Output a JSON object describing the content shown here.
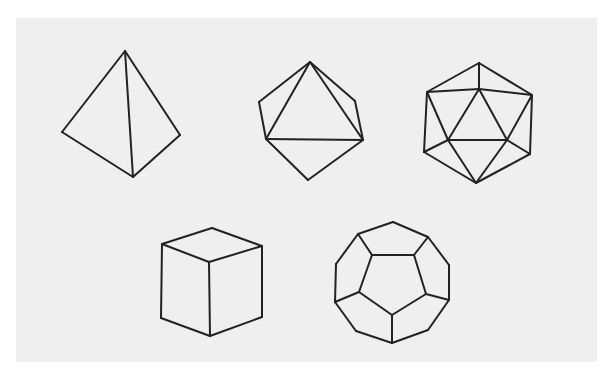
{
  "figure": {
    "background": "#ffffff",
    "panel_color": "#efefef",
    "line_color": "#222222",
    "solids": [
      {
        "name": "tetrahedron",
        "lines": [
          [
            [
              125,
              51
            ],
            [
              62,
              132
            ]
          ],
          [
            [
              62,
              132
            ],
            [
              133,
              177
            ]
          ],
          [
            [
              133,
              177
            ],
            [
              180,
              135
            ]
          ],
          [
            [
              180,
              135
            ],
            [
              125,
              51
            ]
          ],
          [
            [
              125,
              51
            ],
            [
              133,
              177
            ]
          ]
        ]
      },
      {
        "name": "octahedron",
        "lines": [
          [
            [
              310,
              62
            ],
            [
              259,
              102
            ]
          ],
          [
            [
              310,
              62
            ],
            [
              355,
              101
            ]
          ],
          [
            [
              310,
              62
            ],
            [
              266,
              139
            ]
          ],
          [
            [
              310,
              62
            ],
            [
              363,
              140
            ]
          ],
          [
            [
              259,
              102
            ],
            [
              266,
              139
            ]
          ],
          [
            [
              355,
              101
            ],
            [
              363,
              140
            ]
          ],
          [
            [
              266,
              139
            ],
            [
              363,
              140
            ]
          ],
          [
            [
              266,
              139
            ],
            [
              308,
              180
            ]
          ],
          [
            [
              363,
              140
            ],
            [
              308,
              180
            ]
          ]
        ]
      },
      {
        "name": "icosahedron",
        "lines": [
          [
            [
              479,
              63
            ],
            [
              427,
              92
            ]
          ],
          [
            [
              479,
              63
            ],
            [
              532,
              95
            ]
          ],
          [
            [
              479,
              63
            ],
            [
              479,
              89
            ]
          ],
          [
            [
              427,
              92
            ],
            [
              479,
              89
            ]
          ],
          [
            [
              479,
              89
            ],
            [
              532,
              95
            ]
          ],
          [
            [
              427,
              92
            ],
            [
              424,
              152
            ]
          ],
          [
            [
              532,
              95
            ],
            [
              530,
              154
            ]
          ],
          [
            [
              427,
              92
            ],
            [
              448,
              140
            ]
          ],
          [
            [
              479,
              89
            ],
            [
              448,
              140
            ]
          ],
          [
            [
              479,
              89
            ],
            [
              507,
              140
            ]
          ],
          [
            [
              532,
              95
            ],
            [
              507,
              140
            ]
          ],
          [
            [
              448,
              140
            ],
            [
              507,
              140
            ]
          ],
          [
            [
              424,
              152
            ],
            [
              448,
              140
            ]
          ],
          [
            [
              530,
              154
            ],
            [
              507,
              140
            ]
          ],
          [
            [
              424,
              152
            ],
            [
              476,
              183
            ]
          ],
          [
            [
              530,
              154
            ],
            [
              476,
              183
            ]
          ],
          [
            [
              448,
              140
            ],
            [
              476,
              183
            ]
          ],
          [
            [
              507,
              140
            ],
            [
              476,
              183
            ]
          ]
        ]
      },
      {
        "name": "cube",
        "lines": [
          [
            [
              162,
              244
            ],
            [
              212,
              228
            ]
          ],
          [
            [
              212,
              228
            ],
            [
              262,
              246
            ]
          ],
          [
            [
              262,
              246
            ],
            [
              209,
              262
            ]
          ],
          [
            [
              209,
              262
            ],
            [
              162,
              244
            ]
          ],
          [
            [
              162,
              244
            ],
            [
              161,
              318
            ]
          ],
          [
            [
              262,
              246
            ],
            [
              262,
              317
            ]
          ],
          [
            [
              209,
              262
            ],
            [
              210,
              336
            ]
          ],
          [
            [
              161,
              318
            ],
            [
              210,
              336
            ]
          ],
          [
            [
              210,
              336
            ],
            [
              262,
              317
            ]
          ]
        ]
      },
      {
        "name": "dodecahedron",
        "lines": [
          [
            [
              393,
              222
            ],
            [
              428,
              237
            ]
          ],
          [
            [
              428,
              237
            ],
            [
              449,
              265
            ]
          ],
          [
            [
              449,
              265
            ],
            [
              449,
              300
            ]
          ],
          [
            [
              449,
              300
            ],
            [
              428,
              330
            ]
          ],
          [
            [
              428,
              330
            ],
            [
              392,
              343
            ]
          ],
          [
            [
              392,
              343
            ],
            [
              356,
              331
            ]
          ],
          [
            [
              356,
              331
            ],
            [
              335,
              302
            ]
          ],
          [
            [
              335,
              302
            ],
            [
              336,
              264
            ]
          ],
          [
            [
              336,
              264
            ],
            [
              358,
              234
            ]
          ],
          [
            [
              358,
              234
            ],
            [
              393,
              222
            ]
          ],
          [
            [
              372,
              255
            ],
            [
              414,
              255
            ]
          ],
          [
            [
              414,
              255
            ],
            [
              426,
              294
            ]
          ],
          [
            [
              426,
              294
            ],
            [
              392,
              315
            ]
          ],
          [
            [
              392,
              315
            ],
            [
              359,
              292
            ]
          ],
          [
            [
              359,
              292
            ],
            [
              372,
              255
            ]
          ],
          [
            [
              358,
              234
            ],
            [
              372,
              255
            ]
          ],
          [
            [
              428,
              237
            ],
            [
              414,
              255
            ]
          ],
          [
            [
              449,
              300
            ],
            [
              426,
              294
            ]
          ],
          [
            [
              392,
              343
            ],
            [
              392,
              315
            ]
          ],
          [
            [
              335,
              302
            ],
            [
              359,
              292
            ]
          ]
        ]
      }
    ]
  }
}
